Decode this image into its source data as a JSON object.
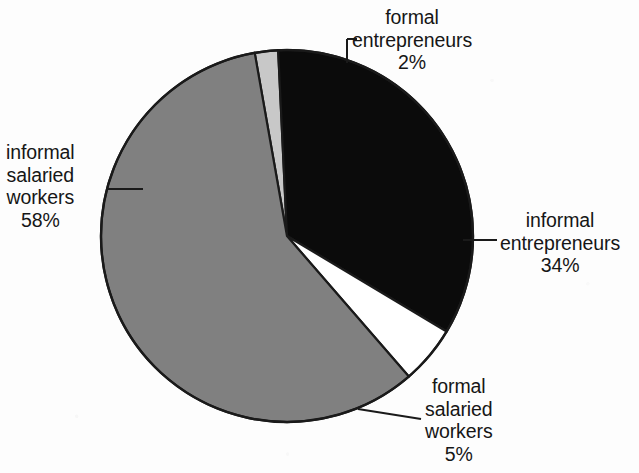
{
  "chart_data": {
    "type": "pie",
    "title": "",
    "subtitle": "",
    "xlabel": "",
    "ylabel": "",
    "legend_position": "none",
    "grid": false,
    "labels_show_percent": true,
    "categories": [
      "informal salaried workers",
      "formal entrepreneurs",
      "informal entrepreneurs",
      "formal salaried workers"
    ],
    "values": [
      58,
      34,
      2,
      5
    ],
    "slices": [
      {
        "id": "informal-salaried-workers",
        "name": "informal salaried workers",
        "name_lines": [
          "informal",
          "salaried",
          "workers"
        ],
        "value": 58,
        "value_label": "58%",
        "color": "#808080",
        "start_angle": -10,
        "end_angle": 198.8
      },
      {
        "id": "formal-entrepreneurs",
        "name": "formal entrepreneurs",
        "name_lines": [
          "formal",
          "entrepreneurs"
        ],
        "value": 2,
        "value_label": "2%",
        "color": "#c8c8c8",
        "start_angle": -10,
        "end_angle": -2.8
      },
      {
        "id": "informal-entrepreneurs",
        "name": "informal entrepreneurs",
        "name_lines": [
          "informal",
          "entrepreneurs"
        ],
        "value": 34,
        "value_label": "34%",
        "color": "#0b0b0b",
        "start_angle": -2.8,
        "end_angle": 119.6
      },
      {
        "id": "formal-salaried-workers",
        "name": "formal salaried workers",
        "name_lines": [
          "formal",
          "salaried",
          "workers"
        ],
        "value": 5,
        "value_label": "5%",
        "color": "#ffffff",
        "start_angle": 119.6,
        "end_angle": 137.6
      }
    ],
    "total": 99,
    "outline_color": "#1a1a1a",
    "background_color": "#fdfdfd",
    "center_x": 287,
    "center_y": 236,
    "radius": 186
  },
  "labels": {
    "formal_entrepreneurs": {
      "lines": [
        "formal",
        "entrepreneurs"
      ],
      "percent": "2%"
    },
    "informal_entrepreneurs": {
      "lines": [
        "informal",
        "entrepreneurs"
      ],
      "percent": "34%"
    },
    "formal_salaried_workers": {
      "lines": [
        "formal",
        "salaried",
        "workers"
      ],
      "percent": "5%"
    },
    "informal_salaried_workers": {
      "lines": [
        "informal",
        "salaried",
        "workers"
      ],
      "percent": "58%"
    }
  }
}
